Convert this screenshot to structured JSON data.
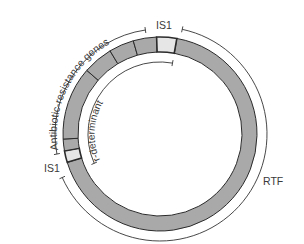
{
  "diagram": {
    "labels": {
      "antibiotic_resistance_genes": "Antibiotic-resistance genes",
      "r_determinant": "r-determinant",
      "is1_top": "IS1",
      "is1_bottom": "IS1",
      "rtf": "RTF"
    },
    "colors": {
      "ring_fill": "#a9a9a9",
      "is_element_fill": "#e6e6e6",
      "outline": "#2b2b2b",
      "label_text": "#3a3a3a"
    },
    "geometry": {
      "center": [
        160,
        134
      ],
      "ring_outer_radius": 97,
      "ring_inner_radius": 82,
      "outer_arc_radius": 106,
      "inner_arc_radius": 72
    },
    "segments": [
      {
        "name": "rtf-region",
        "start_deg": 10,
        "end_deg": 253,
        "fill": "ring"
      },
      {
        "name": "is1-lower",
        "start_deg": 253,
        "end_deg": 260,
        "fill": "is"
      },
      {
        "name": "resistance-gene-1",
        "start_deg": 260,
        "end_deg": 267,
        "fill": "ring"
      },
      {
        "name": "resistance-gene-2",
        "start_deg": 267,
        "end_deg": 311,
        "fill": "ring"
      },
      {
        "name": "resistance-gene-3",
        "start_deg": 311,
        "end_deg": 329,
        "fill": "ring"
      },
      {
        "name": "resistance-gene-4",
        "start_deg": 329,
        "end_deg": 344,
        "fill": "ring"
      },
      {
        "name": "resistance-gene-5",
        "start_deg": 344,
        "end_deg": 358,
        "fill": "ring"
      },
      {
        "name": "is1-upper",
        "start_deg": 358,
        "end_deg": 370,
        "fill": "is"
      }
    ]
  }
}
